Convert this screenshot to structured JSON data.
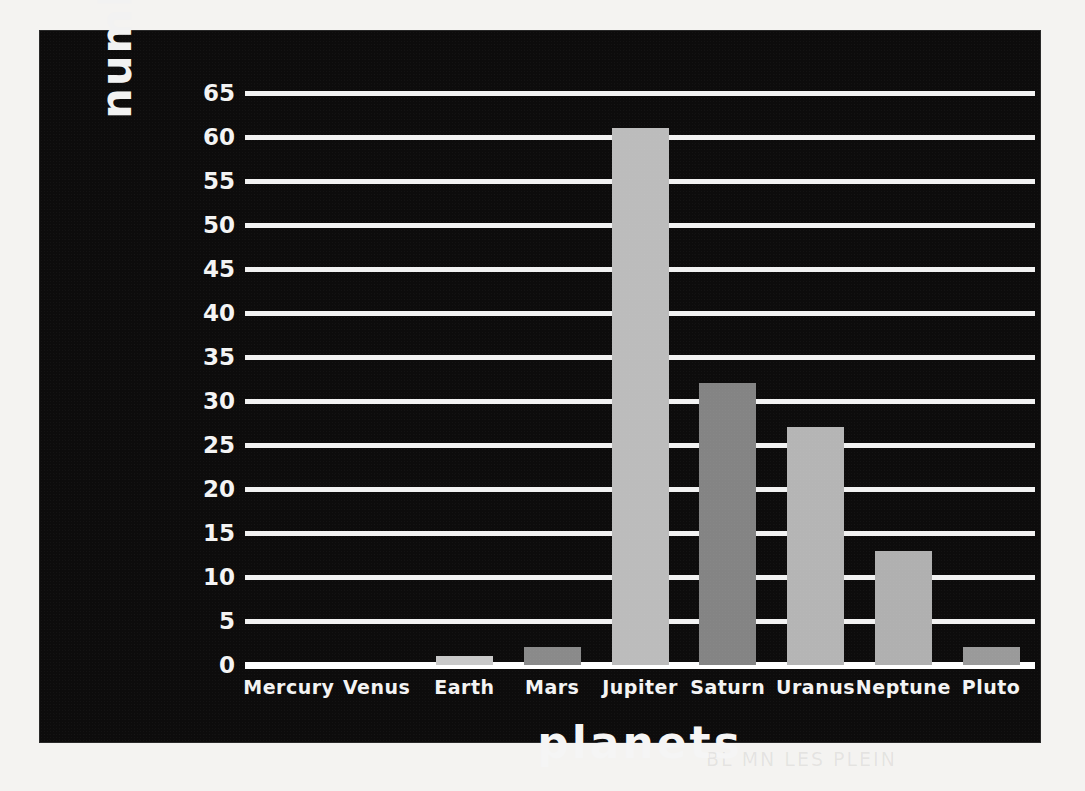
{
  "chart_data": {
    "type": "bar",
    "title": "",
    "xlabel": "planets",
    "ylabel": "number of moons",
    "categories": [
      "Mercury",
      "Venus",
      "Earth",
      "Mars",
      "Jupiter",
      "Saturn",
      "Uranus",
      "Neptune",
      "Pluto"
    ],
    "values": [
      0,
      0,
      1,
      2,
      61,
      32,
      27,
      13,
      2
    ],
    "ylim": [
      0,
      65
    ],
    "ytick_labels": [
      "0",
      "5",
      "10",
      "15",
      "20",
      "25",
      "30",
      "35",
      "40",
      "45",
      "50",
      "55",
      "60",
      "65"
    ],
    "ytick_values": [
      0,
      5,
      10,
      15,
      20,
      25,
      30,
      35,
      40,
      45,
      50,
      55,
      60,
      65
    ],
    "grid": true,
    "legend": "none",
    "bar_colors": [
      "#b9b9b9",
      "#b9b9b9",
      "#c9c9c9",
      "#8a8a8a",
      "#bcbcbc",
      "#848484",
      "#b5b5b5",
      "#b0b0b0",
      "#9a9a9a"
    ],
    "background_color": "#0d0c0c",
    "grid_color": "#f2f2f2",
    "text_color": "#f4f4f4",
    "page_color": "#f4f3f1"
  },
  "ghost_text": {
    "bottom_right": "BL MN LES PLEIN",
    "top": ""
  }
}
